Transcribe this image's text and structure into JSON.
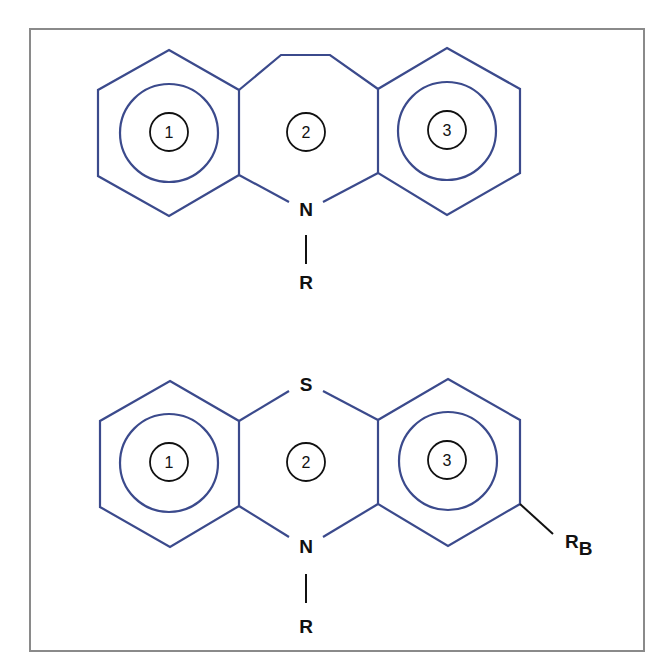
{
  "figure": {
    "border_color": "#8a8a8a",
    "bond_color": "#3b4a8c",
    "structures": [
      {
        "name": "dibenzazepine-core",
        "ring_labels": [
          "1",
          "2",
          "3"
        ],
        "atoms": {
          "nitrogen": "N",
          "substituent": "R"
        }
      },
      {
        "name": "phenothiazine-core",
        "ring_labels": [
          "1",
          "2",
          "3"
        ],
        "atoms": {
          "sulfur": "S",
          "nitrogen": "N",
          "substituent": "R",
          "ring_substituent_main": "R",
          "ring_substituent_sub": "B"
        }
      }
    ]
  }
}
